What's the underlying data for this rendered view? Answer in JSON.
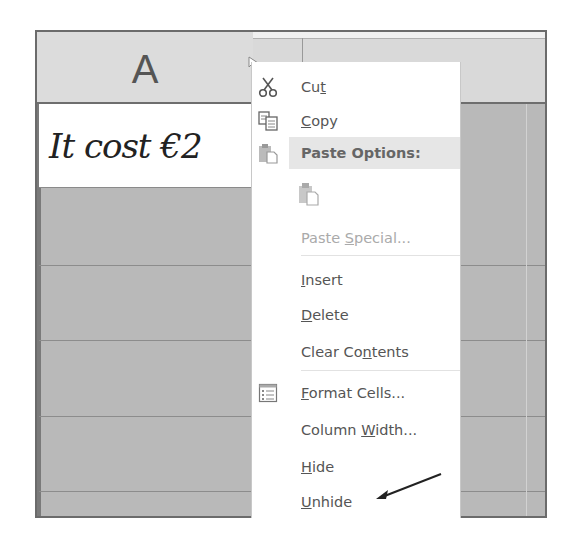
{
  "spreadsheet": {
    "column_headers": [
      "A",
      "C"
    ],
    "cell_a1": "It cost €2"
  },
  "context_menu": {
    "items": [
      {
        "id": "cut",
        "pre": "Cu",
        "u": "t",
        "post": "",
        "icon": "scissors-icon",
        "enabled": true
      },
      {
        "id": "copy",
        "pre": "",
        "u": "C",
        "post": "opy",
        "icon": "copy-icon",
        "enabled": true
      },
      {
        "id": "paste-options",
        "label": "Paste Options:",
        "icon": "paste-icon",
        "type": "header"
      },
      {
        "id": "paste",
        "icon": "paste-icon",
        "type": "paste-button",
        "enabled": false
      },
      {
        "id": "paste-special",
        "pre": "Paste ",
        "u": "S",
        "post": "pecial...",
        "enabled": false
      },
      {
        "id": "insert",
        "pre": "",
        "u": "I",
        "post": "nsert",
        "enabled": true
      },
      {
        "id": "delete",
        "pre": "",
        "u": "D",
        "post": "elete",
        "enabled": true
      },
      {
        "id": "clear-contents",
        "pre": "Clear Co",
        "u": "n",
        "post": "tents",
        "enabled": true
      },
      {
        "id": "format-cells",
        "pre": "",
        "u": "F",
        "post": "ormat Cells...",
        "icon": "format-cells-icon",
        "enabled": true
      },
      {
        "id": "column-width",
        "pre": "Column ",
        "u": "W",
        "post": "idth...",
        "enabled": true
      },
      {
        "id": "hide",
        "pre": "",
        "u": "H",
        "post": "ide",
        "enabled": true
      },
      {
        "id": "unhide",
        "pre": "",
        "u": "U",
        "post": "nhide",
        "enabled": true
      }
    ]
  },
  "annotation": {
    "arrow_target": "Unhide",
    "color": "#222222"
  },
  "colors": {
    "header_bg": "#dcdcdc",
    "grid_bg": "#b9b9b9",
    "menu_bg": "#ffffff",
    "menu_highlight": "#e6e6e6",
    "disabled_text": "#aaaaaa"
  }
}
